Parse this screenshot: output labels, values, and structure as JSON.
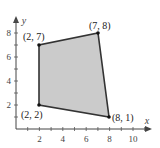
{
  "diagram": {
    "type": "feasible-region-polygon",
    "axes": {
      "x_label": "x",
      "y_label": "y",
      "x_ticks": [
        "2",
        "4",
        "6",
        "8",
        "10"
      ],
      "y_ticks": [
        "2",
        "4",
        "6",
        "8"
      ]
    },
    "vertices": [
      {
        "label": "(2, 2)",
        "x": 2,
        "y": 2
      },
      {
        "label": "(2, 7)",
        "x": 2,
        "y": 7
      },
      {
        "label": "(7, 8)",
        "x": 7,
        "y": 8
      },
      {
        "label": "(8, 1)",
        "x": 8,
        "y": 1
      }
    ],
    "fill_color": "#c8c8c8",
    "edge_color": "#333333"
  }
}
